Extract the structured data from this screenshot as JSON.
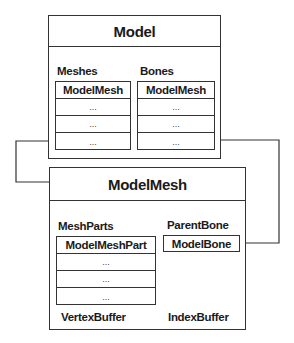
{
  "model": {
    "title": "Model",
    "meshes": {
      "label": "Meshes",
      "header": "ModelMesh",
      "rows": [
        "...",
        "...",
        "..."
      ]
    },
    "bones": {
      "label": "Bones",
      "header": "ModelMesh",
      "rows": [
        "...",
        "...",
        "..."
      ]
    }
  },
  "model_mesh": {
    "title": "ModelMesh",
    "mesh_parts": {
      "label": "MeshParts",
      "header": "ModelMeshPart",
      "rows": [
        "...",
        "...",
        "..."
      ]
    },
    "parent_bone": {
      "label": "ParentBone",
      "value": "ModelBone"
    },
    "vertex_buffer_label": "VertexBuffer",
    "index_buffer_label": "IndexBuffer"
  },
  "colors": {
    "line": "#333333",
    "background": "#ffffff"
  }
}
